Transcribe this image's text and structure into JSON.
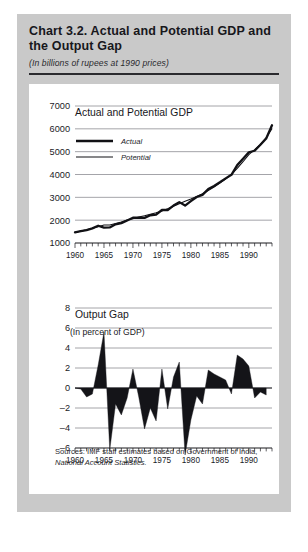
{
  "figure": {
    "title": "Chart 3.2.  Actual and Potential GDP and the Output Gap",
    "subtitle": "(In billions of rupees at 1990 prices)",
    "sources_line1": "Sources:  IMF staff estimates based on Government of India,",
    "sources_line2": "National Account Statistics."
  },
  "chart_data": [
    {
      "type": "line",
      "title": "Actual and Potential GDP",
      "xlabel": "",
      "ylabel": "",
      "xlim": [
        1960,
        1994
      ],
      "ylim": [
        1000,
        7000
      ],
      "yticks": [
        1000,
        2000,
        3000,
        4000,
        5000,
        6000,
        7000
      ],
      "xticks": [
        1960,
        1965,
        1970,
        1975,
        1980,
        1985,
        1990
      ],
      "grid": true,
      "legend_position": "upper-left",
      "x": [
        1960,
        1961,
        1962,
        1963,
        1964,
        1965,
        1966,
        1967,
        1968,
        1969,
        1970,
        1971,
        1972,
        1973,
        1974,
        1975,
        1976,
        1977,
        1978,
        1979,
        1980,
        1981,
        1982,
        1983,
        1984,
        1985,
        1986,
        1987,
        1988,
        1989,
        1990,
        1991,
        1992,
        1993
      ],
      "series": [
        {
          "name": "Actual",
          "values": [
            1470,
            1520,
            1560,
            1640,
            1755,
            1670,
            1680,
            1820,
            1870,
            1985,
            2105,
            2115,
            2100,
            2215,
            2245,
            2445,
            2445,
            2640,
            2790,
            2640,
            2835,
            3015,
            3110,
            3360,
            3500,
            3660,
            3830,
            3985,
            4410,
            4690,
            4975,
            5040,
            5300,
            5580,
            6160
          ]
        },
        {
          "name": "Potential",
          "values": [
            1470,
            1520,
            1575,
            1650,
            1715,
            1785,
            1790,
            1850,
            1920,
            2005,
            2065,
            2135,
            2190,
            2260,
            2320,
            2400,
            2500,
            2610,
            2720,
            2830,
            2930,
            3040,
            3160,
            3300,
            3450,
            3620,
            3800,
            4010,
            4270,
            4560,
            4870,
            5090,
            5320,
            5620,
            6000
          ]
        }
      ]
    },
    {
      "type": "area",
      "title": "Output Gap",
      "subtitle": "(In percent of GDP)",
      "xlabel": "",
      "ylabel": "",
      "xlim": [
        1960,
        1994
      ],
      "ylim": [
        -6,
        8
      ],
      "yticks": [
        -6,
        -4,
        -2,
        0,
        2,
        4,
        6,
        8
      ],
      "xticks": [
        1960,
        1965,
        1970,
        1975,
        1980,
        1985,
        1990
      ],
      "grid": true,
      "x": [
        1960,
        1961,
        1962,
        1963,
        1964,
        1965,
        1966,
        1967,
        1968,
        1969,
        1970,
        1971,
        1972,
        1973,
        1974,
        1975,
        1976,
        1977,
        1978,
        1979,
        1980,
        1981,
        1982,
        1983,
        1984,
        1985,
        1986,
        1987,
        1988,
        1989,
        1990,
        1991,
        1992,
        1993
      ],
      "values": [
        0.0,
        -0.1,
        -0.9,
        -0.6,
        2.3,
        5.6,
        -6.2,
        -1.6,
        -2.7,
        -1.0,
        1.9,
        -0.9,
        -4.1,
        -2.0,
        -3.3,
        1.9,
        -2.1,
        1.1,
        2.6,
        -6.7,
        -3.2,
        -0.8,
        -1.6,
        1.8,
        1.4,
        1.1,
        0.8,
        -0.6,
        3.3,
        2.9,
        2.2,
        -1.0,
        -0.4,
        -0.7
      ]
    }
  ]
}
